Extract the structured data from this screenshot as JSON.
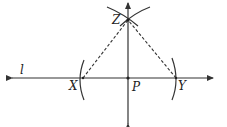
{
  "diagram": {
    "title": "",
    "labels": {
      "line": "l",
      "X": "X",
      "Y": "Y",
      "Z": "Z",
      "P": "P"
    },
    "points": {
      "X": [
        83,
        78
      ],
      "Y": [
        176,
        78
      ],
      "Z": [
        128,
        20
      ],
      "P": [
        128,
        78
      ]
    },
    "colors": {
      "stroke": "#333333",
      "background": "#ffffff"
    }
  }
}
